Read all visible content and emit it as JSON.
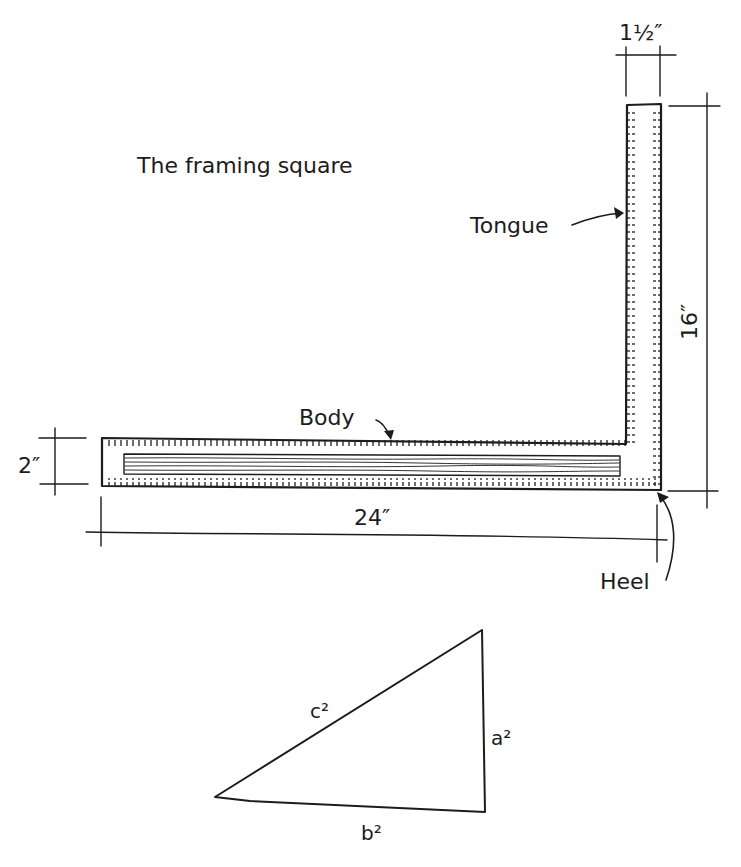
{
  "title": "The framing square",
  "parts": {
    "tongue": "Tongue",
    "body": "Body",
    "heel": "Heel"
  },
  "dimensions": {
    "tongue_width": "1½″",
    "tongue_length": "16″",
    "body_width": "2″",
    "body_length": "24″"
  },
  "triangle": {
    "hypotenuse": "c²",
    "vertical_side": "a²",
    "base": "b²"
  },
  "colors": {
    "ink": "#1c1c1c",
    "paper": "#ffffff"
  }
}
